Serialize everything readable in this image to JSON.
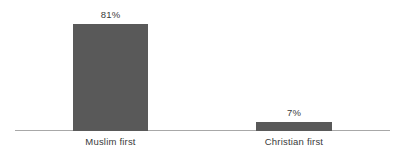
{
  "chart_data": {
    "type": "bar",
    "title": "",
    "subtitle": "",
    "xlabel": "",
    "ylabel": "",
    "categories": [
      "Muslim first",
      "Christian first"
    ],
    "values": [
      81,
      7
    ],
    "value_labels": [
      "81%",
      "7%"
    ],
    "ylim": [
      0,
      100
    ],
    "grid": false,
    "legend": null,
    "axis": {
      "baseline_visible": true,
      "y_axis_visible": false,
      "tick_labels": []
    },
    "colors": {
      "bar": "#595959",
      "axis_line": "#a8a8a8",
      "text": "#3a3a3a",
      "background": "#ffffff"
    }
  }
}
